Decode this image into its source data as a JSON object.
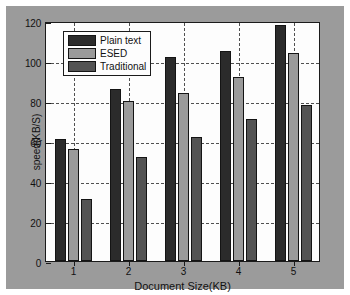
{
  "chart_data": {
    "type": "bar",
    "title": "",
    "subtitle": "",
    "xlabel": "Document Size(KB)",
    "ylabel": "speed(KB/S)",
    "categories": [
      "1",
      "2",
      "3",
      "4",
      "5"
    ],
    "series": [
      {
        "name": "Plain text",
        "values": [
          61,
          86,
          102,
          105,
          118
        ],
        "color": "#2b2b2b"
      },
      {
        "name": "ESED",
        "values": [
          56,
          80,
          84,
          92,
          104
        ],
        "color": "#9a9a9a"
      },
      {
        "name": "Traditional",
        "values": [
          31,
          52,
          62,
          71,
          78
        ],
        "color": "#535353"
      }
    ],
    "ylim": [
      0,
      120
    ],
    "yticks": [
      "0",
      "20",
      "40",
      "60",
      "80",
      "100",
      "120"
    ],
    "ytick_values": [
      0,
      20,
      40,
      60,
      80,
      100,
      120
    ],
    "grid": "horizontal and vertical dotted",
    "legend_position": "top-left inside axes",
    "figure_background": "#9b9b9b",
    "axes_background": "#fdfdfd",
    "axis_color": "#1b1b1b"
  }
}
